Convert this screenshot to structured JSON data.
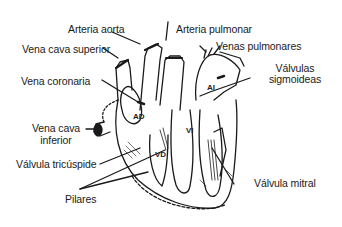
{
  "diagram": {
    "type": "anatomical-illustration",
    "labels": {
      "arteria_aorta": "Arteria aorta",
      "arteria_pulmonar": "Arteria pulmonar",
      "vena_cava_superior": "Vena cava superior",
      "venas_pulmonares": "Venas pulmonares",
      "vena_coronaria": "Vena coronaria",
      "valvulas_sigmoideas_1": "Válvulas",
      "valvulas_sigmoideas_2": "sigmoideas",
      "vena_cava_inferior_1": "Vena cava",
      "vena_cava_inferior_2": "inferior",
      "valvula_tricuspide": "Válvula tricúspide",
      "valvula_mitral": "Válvula mitral",
      "pilares": "Pilares"
    },
    "chambers": {
      "ad": "AD",
      "ai": "AI",
      "vd": "VD",
      "vi": "VI"
    },
    "colors": {
      "ink": "#1a1a1a",
      "background": "#ffffff"
    }
  }
}
